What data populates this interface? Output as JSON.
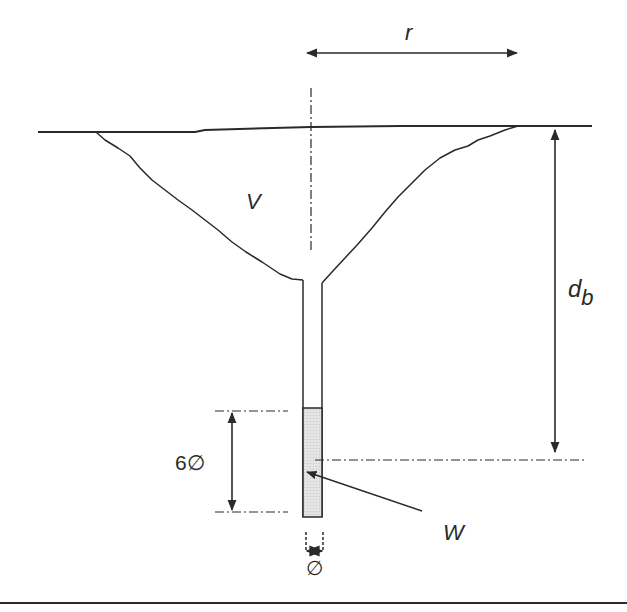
{
  "diagram": {
    "labels": {
      "radius": "r",
      "volume": "V",
      "depth": "d",
      "depth_subscript": "b",
      "charge_length": "6∅",
      "diameter": "∅",
      "charge_weight": "W"
    },
    "colors": {
      "line": "#2a2a2a",
      "charge_fill": "#e2e2e2",
      "background": "#ffffff"
    },
    "elements": [
      {
        "id": "ground-surface",
        "type": "line",
        "description": "ground surface line"
      },
      {
        "id": "crater-profile",
        "type": "curve",
        "description": "crater outline",
        "label": "V"
      },
      {
        "id": "centerline",
        "type": "dash-dot line",
        "description": "crater axis"
      },
      {
        "id": "borehole",
        "type": "rectangle",
        "description": "borehole tube"
      },
      {
        "id": "charge",
        "type": "shaded rectangle",
        "description": "explosive charge",
        "label": "W"
      },
      {
        "id": "radius-dimension",
        "type": "double arrow",
        "label": "r"
      },
      {
        "id": "depth-dimension",
        "type": "double arrow",
        "label": "d_b"
      },
      {
        "id": "charge-length-dimension",
        "type": "double arrow",
        "label": "6∅"
      },
      {
        "id": "diameter-dimension",
        "type": "double arrow",
        "label": "∅"
      },
      {
        "id": "base-line",
        "type": "line",
        "description": "figure bottom rule"
      }
    ]
  }
}
